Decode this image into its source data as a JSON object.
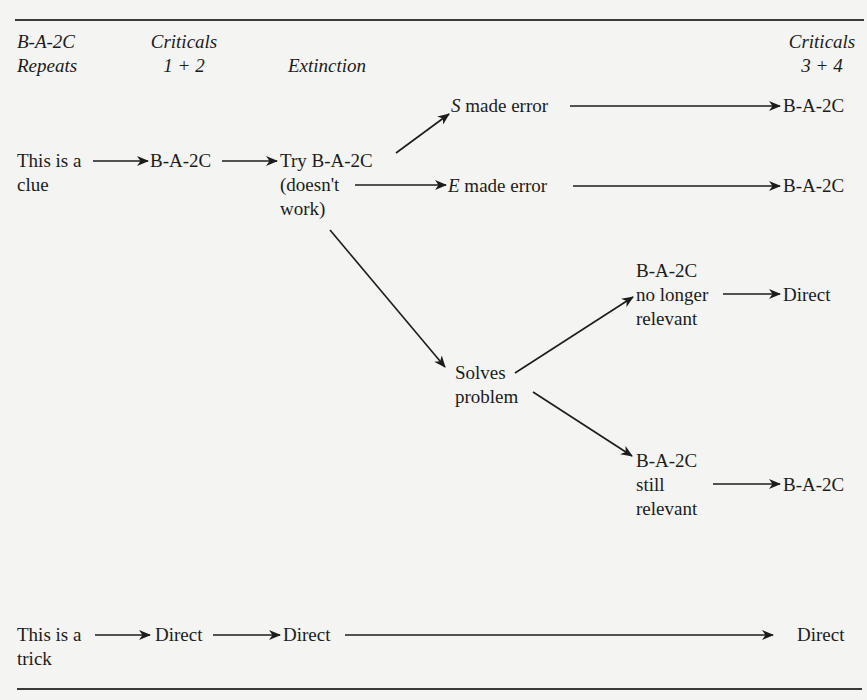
{
  "headers": {
    "col1_line1": "B-A-2C",
    "col1_line2": "Repeats",
    "col2_line1": "Criticals",
    "col2_line2": "1 + 2",
    "col3_line1": "Extinction",
    "col4_line1": "Criticals",
    "col4_line2": "3 + 4"
  },
  "clue_row": {
    "start_line1": "This is a",
    "start_line2": "clue",
    "criticals_1_2": "B-A-2C",
    "extinction_line1": "Try B-A-2C",
    "extinction_line2": "(doesn't",
    "extinction_line3": "work)",
    "s_error_letter": "S",
    "s_error_rest": " made error",
    "s_error_result": "B-A-2C",
    "e_error_letter": "E",
    "e_error_rest": " made error",
    "e_error_result": "B-A-2C",
    "solves_line1": "Solves",
    "solves_line2": "problem",
    "no_longer_line1": "B-A-2C",
    "no_longer_line2": "no longer",
    "no_longer_line3": "relevant",
    "no_longer_result": "Direct",
    "still_line1": "B-A-2C",
    "still_line2": "still",
    "still_line3": "relevant",
    "still_result": "B-A-2C"
  },
  "trick_row": {
    "start_line1": "This is a",
    "start_line2": "trick",
    "criticals_1_2": "Direct",
    "extinction": "Direct",
    "result": "Direct"
  },
  "style": {
    "ink_color": "#1c1c1c",
    "paper_color": "#f4f4f2",
    "rule_color": "#3a3a3a"
  }
}
